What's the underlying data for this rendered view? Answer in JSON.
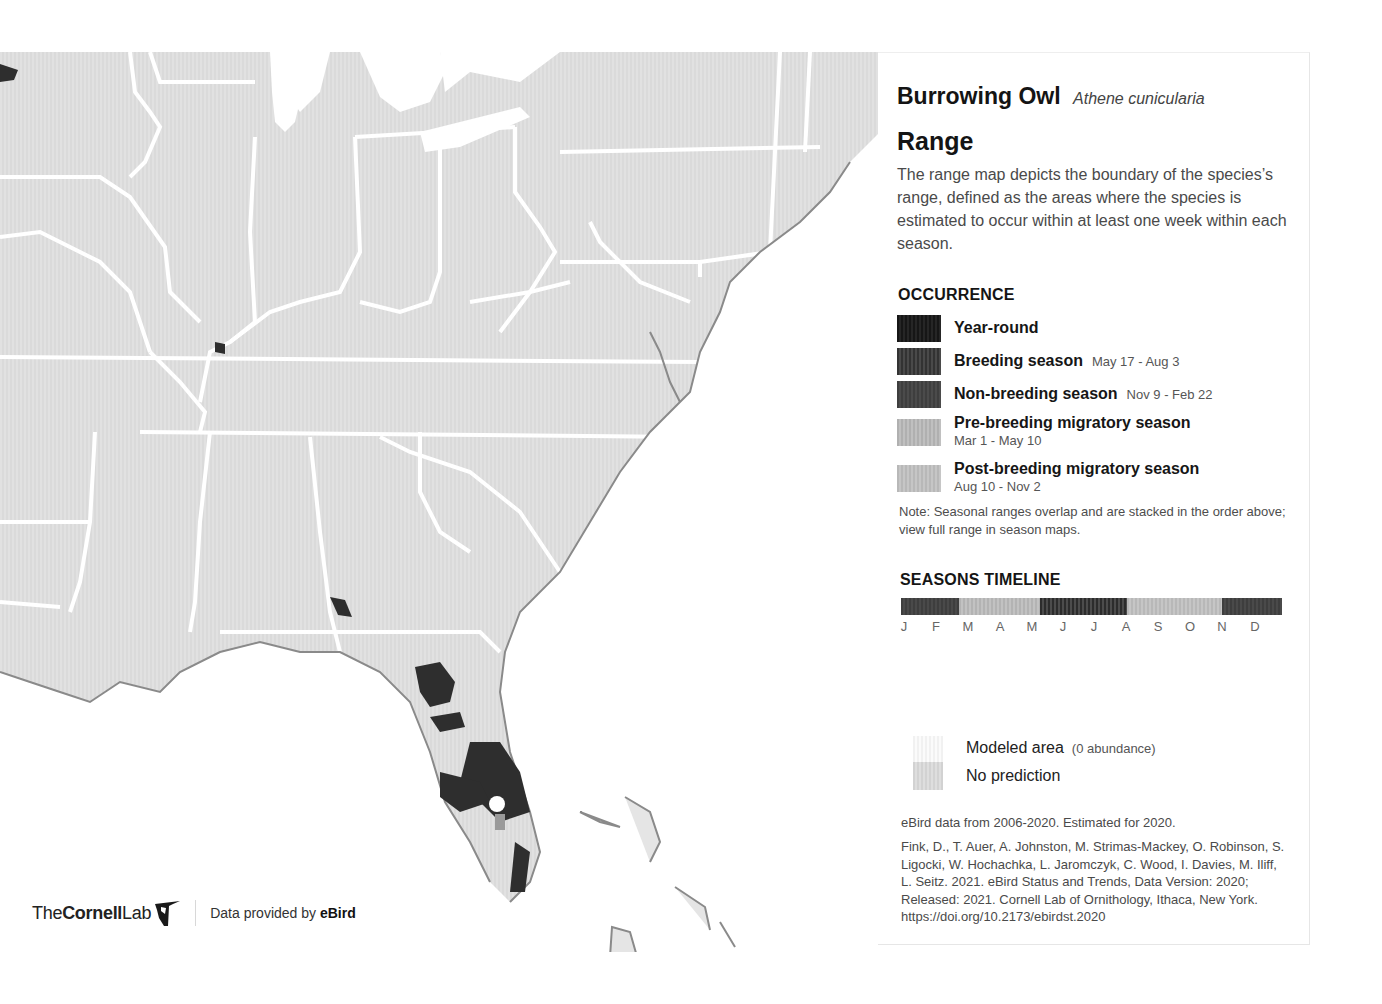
{
  "species": {
    "common_name": "Burrowing Owl",
    "scientific_name": "Athene cunicularia"
  },
  "range": {
    "title": "Range",
    "description": "The range map depicts the boundary of the species’s range, defined as the areas where the species is estimated to occur within at least one week within each season."
  },
  "occurrence": {
    "title": "OCCURRENCE",
    "items": [
      {
        "label": "Year-round",
        "dates": "",
        "color": "#1c1c1c"
      },
      {
        "label": "Breeding season",
        "dates": "May 17 - Aug 3",
        "color": "#3c3c3c"
      },
      {
        "label": "Non-breeding season",
        "dates": "Nov 9 - Feb 22",
        "color": "#454545"
      },
      {
        "label": "Pre-breeding migratory season",
        "dates": "Mar 1 - May 10",
        "color": "#b5b5b5"
      },
      {
        "label": "Post-breeding migratory season",
        "dates": "Aug 10 - Nov 2",
        "color": "#bcbcbc"
      }
    ],
    "note": "Note: Seasonal ranges overlap and are stacked in the order above; view full range in season maps."
  },
  "timeline": {
    "title": "SEASONS TIMELINE",
    "segments": [
      {
        "season": "Non-breeding",
        "start_pct": 0,
        "width_pct": 15.2,
        "color": "#434343"
      },
      {
        "season": "Pre-breeding migratory",
        "start_pct": 15.2,
        "width_pct": 21.3,
        "color": "#b8b8b8"
      },
      {
        "season": "Breeding",
        "start_pct": 36.5,
        "width_pct": 22.8,
        "color": "#3a3a3a"
      },
      {
        "season": "Post-breeding migratory",
        "start_pct": 59.3,
        "width_pct": 24.9,
        "color": "#bdbdbd"
      },
      {
        "season": "Non-breeding",
        "start_pct": 84.2,
        "width_pct": 15.8,
        "color": "#434343"
      }
    ],
    "months": [
      "J",
      "F",
      "M",
      "A",
      "M",
      "J",
      "J",
      "A",
      "S",
      "O",
      "N",
      "D"
    ]
  },
  "extra_legend": {
    "modeled_label": "Modeled area",
    "modeled_sub": "(0 abundance)",
    "no_prediction_label": "No prediction"
  },
  "credits": {
    "data_range": "eBird data from 2006-2020. Estimated for 2020.",
    "citation": "Fink, D., T. Auer, A. Johnston, M. Strimas-Mackey, O. Robinson, S. Ligocki, W. Hochachka, L. Jaromczyk, C. Wood, I. Davies, M. Iliff, L. Seitz. 2021. eBird Status and Trends, Data Version: 2020; Released: 2021. Cornell Lab of Ornithology, Ithaca, New York. https://doi.org/10.2173/ebirdst.2020"
  },
  "footer": {
    "logo_the": "The",
    "logo_cornell": "Cornell",
    "logo_lab": "Lab",
    "provided_prefix": "Data provided by ",
    "provided_brand": "eBird"
  },
  "map": {
    "region": "Eastern United States",
    "land_color": "#dcdcdc",
    "border_color": "#ffffff",
    "coast_color": "#8a8a8a",
    "range_dark_color": "#2e2e2e"
  }
}
